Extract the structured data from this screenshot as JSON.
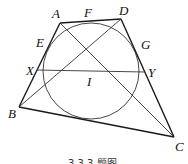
{
  "figure": {
    "caption": "3.3.3 题图",
    "points": {
      "A": {
        "label": "A",
        "x": 60,
        "y": 23,
        "lx": 52,
        "ly": 18
      },
      "D": {
        "label": "D",
        "x": 121,
        "y": 19,
        "lx": 119,
        "ly": 15
      },
      "B": {
        "label": "B",
        "x": 19,
        "y": 107,
        "lx": 8,
        "ly": 118
      },
      "C": {
        "label": "C",
        "x": 174,
        "y": 137,
        "lx": 175,
        "ly": 151
      },
      "I": {
        "label": "I",
        "x": 91,
        "y": 71,
        "lx": 87,
        "ly": 86
      },
      "X": {
        "label": "X",
        "x": 37,
        "y": 70,
        "lx": 26,
        "ly": 75
      },
      "Y": {
        "label": "Y",
        "x": 145,
        "y": 72,
        "lx": 148,
        "ly": 77
      },
      "E": {
        "label": "E",
        "x": 49,
        "y": 42,
        "lx": 36,
        "ly": 47
      },
      "F": {
        "label": "F",
        "x": 91,
        "y": 21,
        "lx": 84,
        "ly": 17
      },
      "G": {
        "label": "G",
        "x": 136,
        "y": 43,
        "lx": 141,
        "ly": 49
      }
    },
    "incircle": {
      "cx": 91,
      "cy": 71,
      "r": 48
    }
  }
}
